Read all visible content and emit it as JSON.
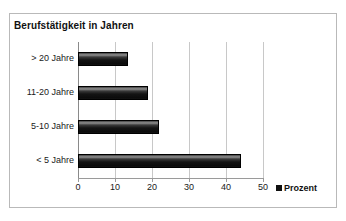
{
  "chart_data": {
    "type": "bar",
    "orientation": "horizontal",
    "title": "Berufstätigkeit in Jahren",
    "categories": [
      "> 20 Jahre",
      "11-20 Jahre",
      "5-10 Jahre",
      "< 5 Jahre"
    ],
    "values": [
      13.5,
      19,
      22,
      44
    ],
    "series": [
      {
        "name": "Prozent",
        "values": [
          13.5,
          19,
          22,
          44
        ]
      }
    ],
    "xlabel": "",
    "ylabel": "",
    "xlim": [
      0,
      50
    ],
    "xticks": [
      0,
      10,
      20,
      30,
      40,
      50
    ],
    "xtick_labels": [
      "0",
      "10",
      "20",
      "30",
      "40",
      "50"
    ],
    "grid": "vertical",
    "legend": {
      "position": "bottom-right",
      "entries": [
        {
          "label": "Prozent",
          "color": "#101010"
        }
      ]
    },
    "colors": {
      "bar": "#101010",
      "gridline": "#c8c8c8",
      "axis": "#9a9a9a",
      "frame": "#b9b9b9",
      "text": "#1a1a1a",
      "background": "#ffffff"
    }
  }
}
